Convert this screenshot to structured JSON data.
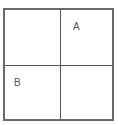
{
  "diagram": {
    "type": "2x2 grid",
    "border_color": "#6a6a6a",
    "line_color": "#555555",
    "quadrants": [
      {
        "position": "top-left",
        "label": ""
      },
      {
        "position": "top-right",
        "label": "A"
      },
      {
        "position": "bottom-left",
        "label": "B"
      },
      {
        "position": "bottom-right",
        "label": ""
      }
    ]
  }
}
